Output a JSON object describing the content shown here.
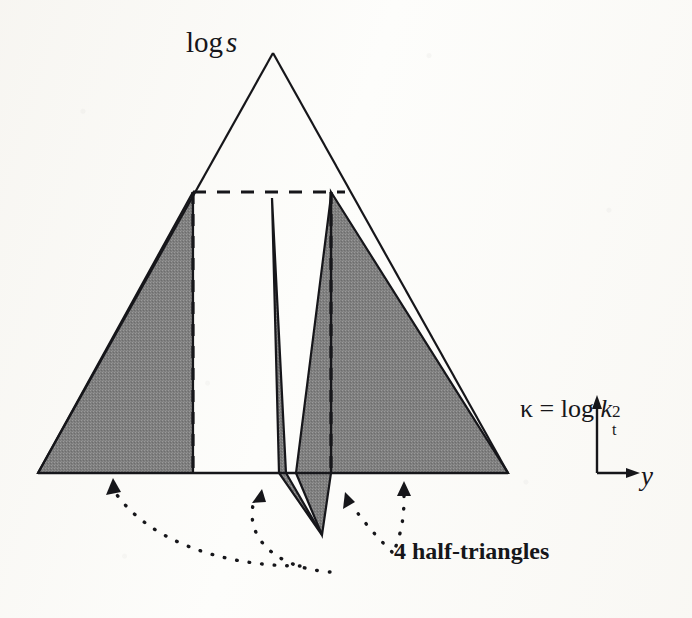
{
  "figure": {
    "name": "log-s-kappa-y-triangle-diagram",
    "background_color": "#fdfdfb",
    "ink_color": "#16161a",
    "shade_color": "#808080",
    "labels": {
      "apex_label": "log s",
      "apex_label_plain": "log",
      "apex_label_italic": "s",
      "vertical_axis_label": "κ = log k",
      "vertical_axis_kappa": "κ",
      "vertical_axis_equals": "=",
      "vertical_axis_log": "log",
      "vertical_axis_k": "k",
      "vertical_axis_superscript": "2",
      "vertical_axis_subscript": "t",
      "horizontal_axis_label": "y",
      "annotation": "4 half-triangles"
    },
    "geometry": {
      "big_triangle": {
        "apex": [
          273,
          53
        ],
        "base_left": [
          38,
          473
        ],
        "base_right": [
          508,
          473
        ]
      },
      "dashed_horizontal": {
        "y": 192,
        "x_start": 193,
        "x_end": 345
      },
      "dashed_vertical_left": {
        "x": 193,
        "y_top": 192,
        "y_bottom": 473
      },
      "dashed_vertical_right": {
        "x": 331,
        "y_top": 192,
        "y_bottom": 473
      },
      "shaded_left_half_triangle": [
        [
          38,
          473
        ],
        [
          193,
          192
        ],
        [
          193,
          473
        ]
      ],
      "shaded_right_half_triangle": [
        [
          331,
          192
        ],
        [
          508,
          473
        ],
        [
          331,
          473
        ]
      ],
      "shaded_center_left_sliver": [
        [
          272,
          198
        ],
        [
          286,
          473
        ],
        [
          322,
          535
        ],
        [
          279,
          473
        ]
      ],
      "shaded_center_right_sliver": [
        [
          331,
          196
        ],
        [
          331,
          473
        ],
        [
          322,
          535
        ],
        [
          296,
          473
        ]
      ],
      "axis_origin": [
        597,
        473
      ],
      "axis_vertical_top": [
        597,
        398
      ],
      "axis_horizontal_end": [
        637,
        473
      ]
    },
    "arrows": {
      "count": 4,
      "targets": [
        "left-half-triangle",
        "center-left-sliver",
        "center-right-sliver",
        "right-half-triangle"
      ],
      "style": "dotted-curved"
    }
  }
}
